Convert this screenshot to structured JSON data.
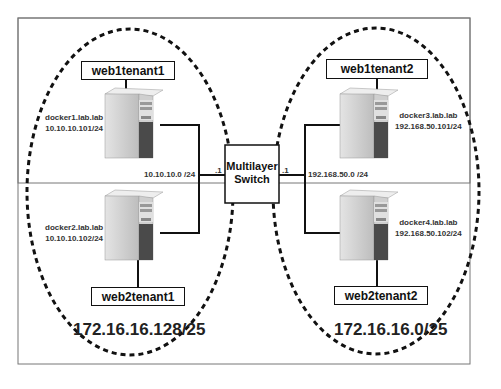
{
  "diagram": {
    "type": "network-topology",
    "switch": {
      "label_line1": "Multilayer",
      "label_line2": "Switch",
      "left_port": ".1",
      "right_port": ".1"
    },
    "left_zone": {
      "subnet": "172.16.16.128/25",
      "network": "10.10.10.0 /24",
      "hosts": [
        {
          "name": "docker1.lab.lab",
          "ip": "10.10.10.101/24",
          "container": "web1tenant1"
        },
        {
          "name": "docker2.lab.lab",
          "ip": "10.10.10.102/24",
          "container": "web2tenant1"
        }
      ]
    },
    "right_zone": {
      "subnet": "172.16.16.0/25",
      "network": "192.168.50.0 /24",
      "hosts": [
        {
          "name": "docker3.lab.lab",
          "ip": "192.168.50.101/24",
          "container": "web1tenant2"
        },
        {
          "name": "docker4.lab.lab",
          "ip": "192.168.50.102/24",
          "container": "web2tenant2"
        }
      ]
    },
    "colors": {
      "line": "#111111",
      "border": "#777777",
      "server_light": "#d8d8d8",
      "server_dark": "#444444"
    }
  }
}
